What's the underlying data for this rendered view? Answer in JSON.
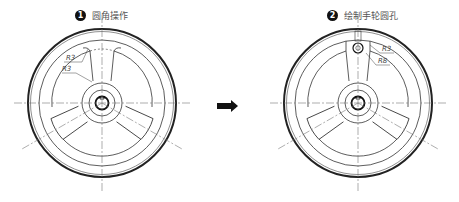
{
  "steps": [
    {
      "number": "1",
      "label": "圆角操作",
      "dimensions": [
        "R3",
        "R3"
      ]
    },
    {
      "number": "2",
      "label": "绘制手轮圆孔",
      "dimensions": [
        "R3",
        "R8"
      ]
    }
  ],
  "arrow": {
    "icon": "right-arrow-icon"
  },
  "colors": {
    "line": "#333333",
    "centerline": "#777777",
    "badge": "#111111",
    "text": "#555555"
  }
}
